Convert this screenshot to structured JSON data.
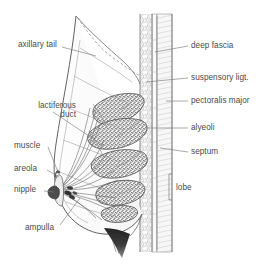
{
  "figure": {
    "background_color": "#ffffff",
    "ink_color": "#4a4a4a",
    "stipple_color": "#6b6b6b"
  },
  "labels_left": [
    {
      "id": "axillary-tail",
      "text": "axillary tail",
      "x": 18,
      "y": 44,
      "lines": 1
    },
    {
      "id": "lactiferous-duct",
      "text": "lactiferous",
      "x": 14,
      "y": 106,
      "lines": 2,
      "text2": "duct"
    },
    {
      "id": "muscle",
      "text": "muscle",
      "x": 14,
      "y": 145,
      "lines": 1
    },
    {
      "id": "areola",
      "text": "areola",
      "x": 14,
      "y": 168,
      "lines": 1
    },
    {
      "id": "nipple",
      "text": "nipple",
      "x": 14,
      "y": 189,
      "lines": 1
    },
    {
      "id": "ampulla",
      "text": "ampulla",
      "x": 28,
      "y": 227,
      "lines": 1
    }
  ],
  "labels_right": [
    {
      "id": "deep-fascia",
      "text": "deep fascia",
      "x": 190,
      "y": 44
    },
    {
      "id": "suspensory-ligt",
      "text": "suspensory ligt.",
      "x": 190,
      "y": 76
    },
    {
      "id": "pectoralis-major",
      "text": "pectoralis major",
      "x": 190,
      "y": 100
    },
    {
      "id": "alyeoli",
      "text": "alyeoli",
      "x": 190,
      "y": 126
    },
    {
      "id": "septum",
      "text": "septum",
      "x": 190,
      "y": 150
    },
    {
      "id": "lobe",
      "text": "lobe",
      "x": 176,
      "y": 188
    }
  ],
  "structures": {
    "axillary_tail_outline": "dashed",
    "lobule_count": 5,
    "duct_rays": 14,
    "chest_wall_bands": [
      "deep fascia",
      "pectoralis major",
      "rib/intercostal"
    ]
  }
}
